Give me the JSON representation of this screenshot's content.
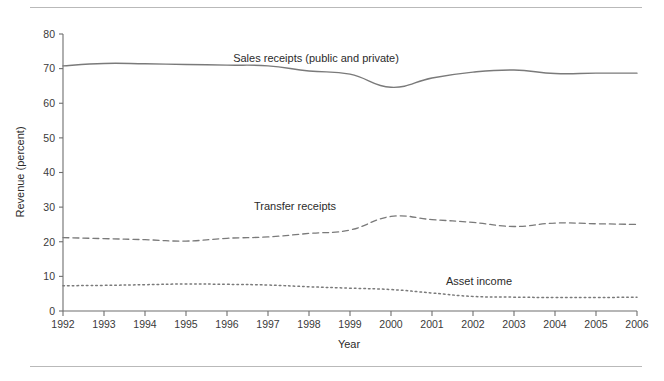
{
  "chart_data": {
    "type": "line",
    "title": "",
    "xlabel": "Year",
    "ylabel": "Revenue (percent)",
    "x": [
      1992,
      1993,
      1994,
      1995,
      1996,
      1997,
      1998,
      1999,
      2000,
      2001,
      2002,
      2003,
      2004,
      2005,
      2006
    ],
    "categories": [
      "1992",
      "1993",
      "1994",
      "1995",
      "1996",
      "1997",
      "1998",
      "1999",
      "2000",
      "2001",
      "2002",
      "2003",
      "2004",
      "2005",
      "2006"
    ],
    "xlim": [
      1992,
      2006
    ],
    "ylim": [
      0,
      80
    ],
    "yticks": [
      0,
      10,
      20,
      30,
      40,
      50,
      60,
      70,
      80
    ],
    "ytick_labels": [
      "0",
      "10",
      "20",
      "30",
      "40",
      "50",
      "60",
      "70",
      "80"
    ],
    "grid": false,
    "legend": "inline-labels",
    "series": [
      {
        "name": "Sales receipts (public and private)",
        "style": "solid",
        "color": "#7a7a7a",
        "label_text": "Sales receipts (public and private)",
        "values": [
          70.8,
          71.5,
          71.4,
          71.2,
          71.0,
          70.8,
          69.3,
          68.4,
          64.6,
          67.3,
          69.0,
          69.6,
          68.6,
          68.7,
          68.7
        ]
      },
      {
        "name": "Transfer receipts",
        "style": "dashed",
        "color": "#7a7a7a",
        "label_text": "Transfer receipts",
        "values": [
          21.2,
          20.9,
          20.6,
          20.2,
          21.0,
          21.4,
          22.4,
          23.4,
          27.3,
          26.4,
          25.6,
          24.4,
          25.4,
          25.2,
          25.0
        ]
      },
      {
        "name": "Asset income",
        "style": "dotted",
        "color": "#7a7a7a",
        "label_text": "Asset income",
        "values": [
          7.3,
          7.4,
          7.6,
          7.8,
          7.7,
          7.5,
          7.0,
          6.6,
          6.2,
          5.2,
          4.2,
          4.0,
          3.9,
          3.9,
          4.0
        ]
      }
    ],
    "annotations": [
      {
        "text": "Sales receipts (public and private)",
        "x_px": 316,
        "y_px": 62
      },
      {
        "text": "Transfer receipts",
        "x_px": 295,
        "y_px": 210
      },
      {
        "text": "Asset income",
        "x_px": 479,
        "y_px": 285
      }
    ]
  }
}
